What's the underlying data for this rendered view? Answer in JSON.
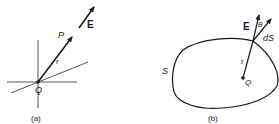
{
  "figure": {
    "panel_a": {
      "caption": "(a)",
      "labels": {
        "field": "E",
        "point": "P",
        "radius": "r",
        "charge": "Q"
      }
    },
    "panel_b": {
      "caption": "(b)",
      "labels": {
        "field": "E",
        "angle": "θ",
        "area_element": "dS",
        "radius": "r",
        "charge": "Q",
        "surface": "S"
      }
    },
    "colors": {
      "ink": "#1a1a1a",
      "background": "#ffffff"
    }
  }
}
